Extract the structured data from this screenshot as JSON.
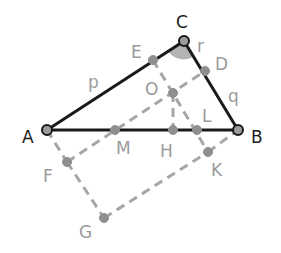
{
  "diagram": {
    "type": "geometry",
    "points": {
      "A": {
        "x": 47,
        "y": 130,
        "label": "A"
      },
      "B": {
        "x": 238,
        "y": 130,
        "label": "B"
      },
      "C": {
        "x": 184,
        "y": 41,
        "label": "C"
      },
      "E": {
        "x": 153,
        "y": 60,
        "label": "E"
      },
      "D": {
        "x": 205,
        "y": 71,
        "label": "D"
      },
      "O": {
        "x": 173,
        "y": 93,
        "label": "O"
      },
      "H": {
        "x": 173,
        "y": 130,
        "label": "H"
      },
      "L": {
        "x": 197,
        "y": 130,
        "label": "L"
      },
      "M": {
        "x": 115,
        "y": 130,
        "label": "M"
      },
      "F": {
        "x": 67,
        "y": 162,
        "label": "F"
      },
      "G": {
        "x": 104,
        "y": 218,
        "label": "G"
      },
      "K": {
        "x": 208,
        "y": 152,
        "label": "K"
      }
    },
    "side_labels": {
      "p": "p",
      "q": "q",
      "r": "r"
    },
    "solid_segments": [
      [
        "A",
        "C"
      ],
      [
        "C",
        "B"
      ],
      [
        "A",
        "B"
      ]
    ],
    "dashed_segments": [
      [
        "A",
        "F"
      ],
      [
        "F",
        "G"
      ],
      [
        "G",
        "K"
      ],
      [
        "K",
        "B"
      ],
      [
        "F",
        "D"
      ],
      [
        "E",
        "K"
      ],
      [
        "O",
        "H"
      ]
    ],
    "angle_marker": {
      "at": "C",
      "color": "#b0b0b0"
    },
    "colors": {
      "main": "#1a1a1a",
      "auxiliary": "#a6a6a6",
      "label_gray": "#9a9a9a"
    }
  }
}
